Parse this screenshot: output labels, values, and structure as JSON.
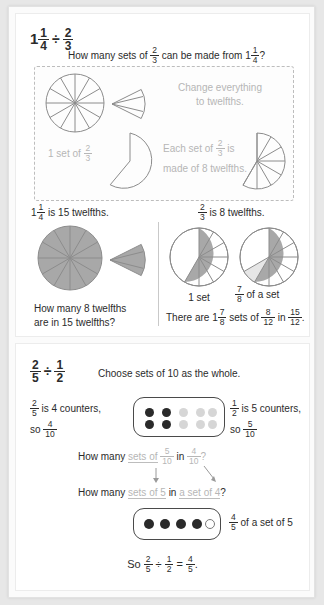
{
  "document": {
    "title": "Dividing Fractions Worked Examples"
  },
  "panel1": {
    "name": "one-and-one-quarter-divided-by-two-thirds",
    "equation": {
      "whole": "1",
      "a_num": "1",
      "a_den": "4",
      "operator": "÷",
      "b_num": "2",
      "b_den": "3"
    },
    "question": {
      "pre": "How many sets of",
      "frac_num": "2",
      "frac_den": "3",
      "mid": "can be made from",
      "whole": "1",
      "m_num": "1",
      "m_den": "4",
      "post": "?"
    },
    "dashed_box": {
      "hint1_line1": "Change everything",
      "hint1_line2": "to twelfths.",
      "label_left": {
        "pre": "1 set of",
        "num": "2",
        "den": "3"
      },
      "hint2_line1_pre": "Each set of",
      "hint2_line1_num": "2",
      "hint2_line1_den": "3",
      "hint2_line1_post": "is",
      "hint2_line2": "made of 8 twelfths."
    },
    "caption_left": {
      "whole": "1",
      "num": "1",
      "den": "4",
      "text": "is 15 twelfths."
    },
    "caption_right": {
      "num": "2",
      "den": "3",
      "text": "is 8 twelfths."
    },
    "question_left_line1": "How many 8 twelfths",
    "question_left_line2": "are in 15 twelfths?",
    "label_one_set": "1 set",
    "label_seven_eighths": {
      "num": "7",
      "den": "8",
      "text": "of a set"
    },
    "conclusion": {
      "pre": "There are",
      "whole": "1",
      "mix_num": "7",
      "mix_den": "8",
      "mid": "sets of",
      "f1_num": "8",
      "f1_den": "12",
      "in": "in",
      "f2_num": "15",
      "f2_den": "12",
      "post": "."
    }
  },
  "panel2": {
    "name": "two-fifths-divided-by-one-half",
    "equation": {
      "a_num": "2",
      "a_den": "5",
      "operator": "÷",
      "b_num": "1",
      "b_den": "2"
    },
    "instruction": "Choose sets of 10 as the whole.",
    "left_label": {
      "num": "2",
      "den": "5",
      "text": "is 4 counters,",
      "so": "so",
      "so_num": "4",
      "so_den": "10"
    },
    "right_label": {
      "num": "1",
      "den": "2",
      "text": "is 5 counters,",
      "so": "so",
      "so_num": "5",
      "so_den": "10"
    },
    "counters_grid": {
      "rows": 2,
      "cols": 5,
      "states": [
        [
          "dark",
          "dark",
          "light",
          "light",
          "light"
        ],
        [
          "dark",
          "dark",
          "light",
          "light",
          "light"
        ]
      ]
    },
    "question_a": {
      "pre": "How many",
      "g1": "sets of",
      "f1_num": "5",
      "f1_den": "10",
      "in": "in",
      "f2_num": "4",
      "f2_den": "10",
      "post": "?"
    },
    "question_b": {
      "pre": "How many",
      "g1": "sets of 5",
      "mid": "in",
      "g2": "a set of 4",
      "post": "?"
    },
    "counters_row": {
      "count": 5,
      "states": [
        "dark",
        "dark",
        "dark",
        "dark",
        "open"
      ]
    },
    "result_label": {
      "num": "4",
      "den": "5",
      "text": "of a set of 5"
    },
    "conclusion": {
      "pre": "So",
      "a_num": "2",
      "a_den": "5",
      "op": "÷",
      "b_num": "1",
      "b_den": "2",
      "eq": "=",
      "c_num": "4",
      "c_den": "5",
      "post": "."
    }
  },
  "colors": {
    "page_background": "#e7e7e7",
    "sheet": "#fbfbfb",
    "panel": "#ffffff",
    "shaded_pie": "#a8a8a8",
    "pie_outline": "#8c8c8c",
    "light_slice": "#e6e6e6",
    "dark_counter": "#2a2a2a",
    "light_counter": "#d6d6d6",
    "hint_gray": "#b6b6b6",
    "text": "#2b2b2b"
  }
}
